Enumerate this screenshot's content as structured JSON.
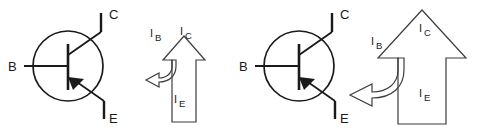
{
  "figure": {
    "background_color": "#ffffff",
    "stroke_color": "#1a1a1a",
    "thin_stroke_color": "#3d3d3d",
    "width": 477,
    "height": 132
  },
  "panels": [
    {
      "id": "left-panel",
      "transistor": {
        "type": "pnp-transistor-symbol",
        "terminals": [
          {
            "id": "base",
            "label": "B"
          },
          {
            "id": "collector",
            "label": "C"
          },
          {
            "id": "emitter",
            "label": "E"
          }
        ]
      },
      "current_arrows": {
        "emitter": {
          "symbol": "I",
          "subscript": "E"
        },
        "collector": {
          "symbol": "I",
          "subscript": "C"
        },
        "base": {
          "symbol": "I",
          "subscript": "B"
        }
      }
    },
    {
      "id": "right-panel",
      "transistor": {
        "type": "pnp-transistor-symbol",
        "terminals": [
          {
            "id": "base",
            "label": "B"
          },
          {
            "id": "collector",
            "label": "C"
          },
          {
            "id": "emitter",
            "label": "E"
          }
        ]
      },
      "current_arrows": {
        "emitter": {
          "symbol": "I",
          "subscript": "E"
        },
        "collector": {
          "symbol": "I",
          "subscript": "C"
        },
        "base": {
          "symbol": "I",
          "subscript": "B"
        }
      }
    }
  ]
}
